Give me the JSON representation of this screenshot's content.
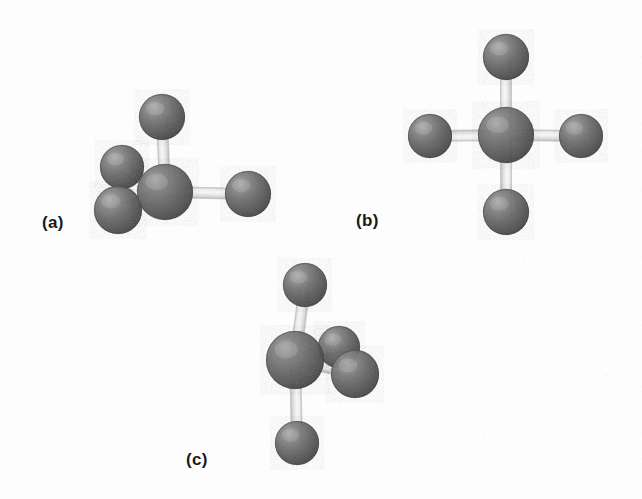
{
  "figure": {
    "background_color": "#fdfdfd",
    "width": 642,
    "height": 499,
    "atom_color_dark": "#5a5a5a",
    "atom_color_mid": "#6e6e6e",
    "atom_color_highlight": "#b8b8b8",
    "atom_color_shadow": "#3a3a3a",
    "bond_color": "#e3e3e3",
    "bond_color_light": "#f4f4f4",
    "bond_color_edge": "#c6c6c6",
    "label_color": "#1a1a1a"
  },
  "panels": [
    {
      "id": "a",
      "label": "(a)",
      "label_x": 42,
      "label_y": 213,
      "geometry_name": "tetrahedral",
      "central_atom": {
        "cx": 165,
        "cy": 192,
        "r": 28
      },
      "terminal_atoms": [
        {
          "name": "top",
          "cx": 162,
          "cy": 117,
          "r": 23
        },
        {
          "name": "upper-left",
          "cx": 122,
          "cy": 167,
          "r": 22
        },
        {
          "name": "lower-left",
          "cx": 118,
          "cy": 210,
          "r": 24
        },
        {
          "name": "right",
          "cx": 248,
          "cy": 194,
          "r": 23
        }
      ],
      "bonds": [
        {
          "from": "center",
          "to": "top",
          "width": 11
        },
        {
          "from": "center",
          "to": "upper-left",
          "width": 11
        },
        {
          "from": "center",
          "to": "lower-left",
          "width": 11
        },
        {
          "from": "center",
          "to": "right",
          "width": 11
        }
      ]
    },
    {
      "id": "b",
      "label": "(b)",
      "label_x": 356,
      "label_y": 211,
      "geometry_name": "square planar",
      "central_atom": {
        "cx": 506,
        "cy": 135,
        "r": 28
      },
      "terminal_atoms": [
        {
          "name": "top",
          "cx": 506,
          "cy": 57,
          "r": 23
        },
        {
          "name": "left",
          "cx": 430,
          "cy": 136,
          "r": 22
        },
        {
          "name": "right",
          "cx": 581,
          "cy": 136,
          "r": 22
        },
        {
          "name": "bottom",
          "cx": 506,
          "cy": 212,
          "r": 23
        }
      ],
      "bonds": [
        {
          "from": "center",
          "to": "top",
          "width": 11
        },
        {
          "from": "center",
          "to": "left",
          "width": 11
        },
        {
          "from": "center",
          "to": "right",
          "width": 11
        },
        {
          "from": "center",
          "to": "bottom",
          "width": 11
        }
      ]
    },
    {
      "id": "c",
      "label": "(c)",
      "label_x": 186,
      "label_y": 450,
      "geometry_name": "tetrahedral (alternate orientation)",
      "central_atom": {
        "cx": 295,
        "cy": 360,
        "r": 29
      },
      "terminal_atoms": [
        {
          "name": "top",
          "cx": 305,
          "cy": 285,
          "r": 22
        },
        {
          "name": "right-upper",
          "cx": 339,
          "cy": 347,
          "r": 21
        },
        {
          "name": "right-lower",
          "cx": 355,
          "cy": 374,
          "r": 24
        },
        {
          "name": "bottom",
          "cx": 297,
          "cy": 443,
          "r": 22
        }
      ],
      "bonds": [
        {
          "from": "center",
          "to": "top",
          "width": 11
        },
        {
          "from": "center",
          "to": "right-upper",
          "width": 11
        },
        {
          "from": "center",
          "to": "right-lower",
          "width": 11
        },
        {
          "from": "center",
          "to": "bottom",
          "width": 11
        }
      ]
    }
  ]
}
